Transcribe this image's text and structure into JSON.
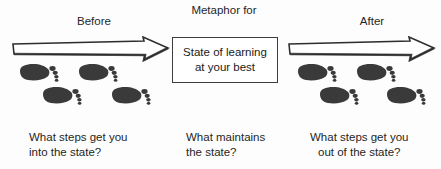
{
  "colors": {
    "background": "#fdfdfd",
    "ink": "#1a1a1a",
    "footprint": "#3a3a3a",
    "arrow_outline": "#2e2e2e",
    "arrow_fill": "#ffffff",
    "box_border": "#3d3d3d"
  },
  "labels": {
    "before": "Before",
    "after": "After",
    "metaphor": "Metaphor for"
  },
  "state_box": {
    "line1": "State of learning",
    "line2": "at your best"
  },
  "captions": {
    "left": {
      "line1": "What steps get you",
      "line2": "into the state?"
    },
    "center": {
      "line1": "What maintains",
      "line2": "the state?"
    },
    "right": {
      "line1": "What steps get you",
      "line2": "out of the state?"
    }
  },
  "icons": {
    "arrow_left": "right-arrow-icon",
    "arrow_right": "right-arrow-icon",
    "footprint": "footprint-icon"
  },
  "footprints": {
    "left_group_count": 4,
    "right_group_count": 4
  }
}
